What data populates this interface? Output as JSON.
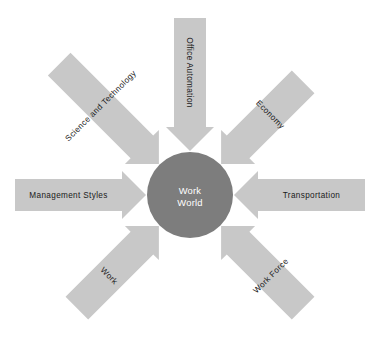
{
  "diagram": {
    "kind": "radial-hub-and-spoke",
    "canvas": {
      "width": 371,
      "height": 345
    },
    "background_color": "#ffffff",
    "hub": {
      "name": "work-world-hub",
      "line1": "Work",
      "line2": "World",
      "center_x": 190,
      "center_y": 195,
      "radius": 43,
      "fill_color": "#7d7d7d",
      "text_color": "#ffffff"
    },
    "arrow_style": {
      "fill_color": "#c8c8c8",
      "text_color": "#1a1a1a",
      "body_half_width": 16,
      "head_half_width": 24,
      "head_length": 24
    },
    "spokes": [
      {
        "id": "office-automation",
        "label": "Office Automation",
        "angle_deg": 270,
        "text_rotation_deg": 90,
        "tail_radius": 177,
        "tip_radius": 44
      },
      {
        "id": "economy",
        "label": "Economy",
        "angle_deg": 315,
        "text_rotation_deg": 45,
        "tail_radius": 160,
        "tip_radius": 44
      },
      {
        "id": "transportation",
        "label": "Transportation",
        "angle_deg": 0,
        "text_rotation_deg": 0,
        "tail_radius": 175,
        "tip_radius": 44
      },
      {
        "id": "work-force",
        "label": "Work Force",
        "angle_deg": 45,
        "text_rotation_deg": -45,
        "tail_radius": 160,
        "tip_radius": 44
      },
      {
        "id": "work",
        "label": "Work",
        "angle_deg": 135,
        "text_rotation_deg": 45,
        "tail_radius": 160,
        "tip_radius": 44
      },
      {
        "id": "management-styles",
        "label": "Management Styles",
        "angle_deg": 180,
        "text_rotation_deg": 0,
        "tail_radius": 175,
        "tip_radius": 44
      },
      {
        "id": "science-and-technology",
        "label": "Science and Technology",
        "angle_deg": 225,
        "text_rotation_deg": -45,
        "tail_radius": 185,
        "tip_radius": 44
      }
    ]
  }
}
